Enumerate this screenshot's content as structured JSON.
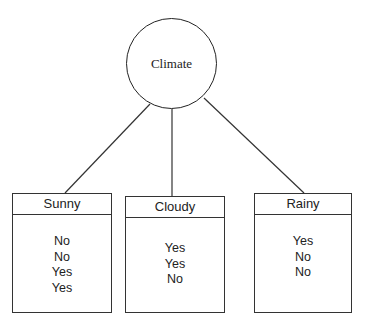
{
  "root": {
    "label": "Climate"
  },
  "leaves": [
    {
      "label": "Sunny",
      "values": [
        "No",
        "No",
        "Yes",
        "Yes"
      ]
    },
    {
      "label": "Cloudy",
      "values": [
        "Yes",
        "Yes",
        "No"
      ]
    },
    {
      "label": "Rainy",
      "values": [
        "Yes",
        "No",
        "No"
      ]
    }
  ]
}
